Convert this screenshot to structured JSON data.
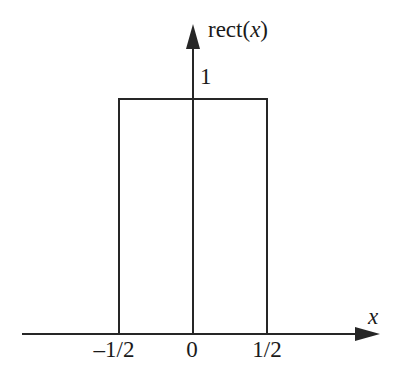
{
  "chart_data": {
    "type": "line",
    "title": "",
    "function_label": "rect(x)",
    "function_label_prefix": "rect(",
    "function_label_var": "x",
    "function_label_suffix": ")",
    "xlabel": "x",
    "ylabel": "rect(x)",
    "xlim": [
      -1.35,
      1.35
    ],
    "ylim": [
      0,
      1.25
    ],
    "grid": false,
    "legend": null,
    "line_color": "#262626",
    "background_color": "#ffffff",
    "x_tick_labels": [
      "–1/2",
      "0",
      "1/2"
    ],
    "x_tick_values": [
      -0.5,
      0,
      0.5
    ],
    "y_tick_labels": [
      "1"
    ],
    "y_tick_values": [
      1
    ],
    "series": [
      {
        "name": "rect(x)",
        "x": [
          -1.35,
          -0.5,
          -0.5,
          0.5,
          0.5,
          1.35
        ],
        "values": [
          0,
          0,
          1,
          1,
          0,
          0
        ]
      }
    ],
    "annotations": [
      {
        "text": "rect(x)",
        "position": "top of y-axis, right side"
      },
      {
        "text": "1",
        "position": "y-axis, just above rectangle top"
      },
      {
        "text": "x",
        "position": "right end of x-axis"
      }
    ]
  },
  "axes": {
    "x_axis_name": "x",
    "y_axis_name": "rect(x)",
    "x_arrow": "arrow-right",
    "y_arrow": "arrow-up"
  },
  "labels": {
    "amplitude": "1",
    "tick_neg_half": "–1/2",
    "tick_zero": "0",
    "tick_pos_half": "1/2",
    "x_axis": "x"
  }
}
